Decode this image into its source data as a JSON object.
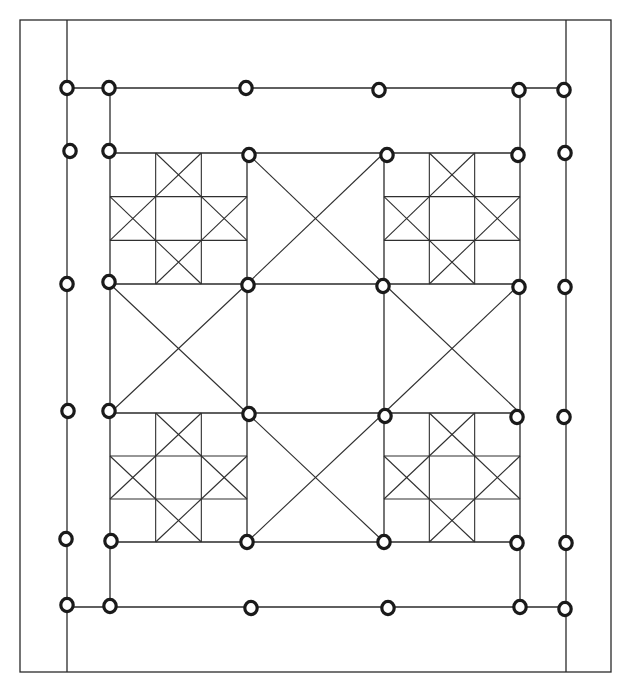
{
  "diagram": {
    "title": "",
    "type": "quilt-grid-layout",
    "frame": {
      "x1": 20,
      "y1": 20,
      "x2": 611,
      "y2": 672
    },
    "outer_verticals": [
      67,
      566
    ],
    "outer_horizontals": [
      88,
      607
    ],
    "inner_x": [
      110,
      247,
      384,
      520
    ],
    "inner_y": [
      153,
      284,
      413,
      542
    ],
    "star_blocks": [
      {
        "position": "top-left",
        "x1": 110,
        "y1": 153,
        "x2": 247,
        "y2": 284
      },
      {
        "position": "top-right",
        "x1": 384,
        "y1": 153,
        "x2": 520,
        "y2": 284
      },
      {
        "position": "bottom-left",
        "x1": 110,
        "y1": 413,
        "x2": 247,
        "y2": 542
      },
      {
        "position": "bottom-right",
        "x1": 384,
        "y1": 413,
        "x2": 520,
        "y2": 542
      }
    ],
    "x_blocks": [
      {
        "position": "top-center",
        "x1": 247,
        "y1": 153,
        "x2": 384,
        "y2": 284
      },
      {
        "position": "middle-left",
        "x1": 110,
        "y1": 284,
        "x2": 247,
        "y2": 413
      },
      {
        "position": "middle-right",
        "x1": 384,
        "y1": 284,
        "x2": 520,
        "y2": 413
      },
      {
        "position": "bottom-center",
        "x1": 247,
        "y1": 413,
        "x2": 384,
        "y2": 542
      }
    ],
    "plain_blocks": [
      {
        "position": "center",
        "x1": 247,
        "y1": 284,
        "x2": 384,
        "y2": 413
      }
    ],
    "nodes": [
      {
        "x": 67,
        "y": 88
      },
      {
        "x": 109,
        "y": 88
      },
      {
        "x": 246,
        "y": 88
      },
      {
        "x": 379,
        "y": 90
      },
      {
        "x": 519,
        "y": 90
      },
      {
        "x": 564,
        "y": 90
      },
      {
        "x": 70,
        "y": 151
      },
      {
        "x": 109,
        "y": 151
      },
      {
        "x": 249,
        "y": 155
      },
      {
        "x": 387,
        "y": 155
      },
      {
        "x": 518,
        "y": 155
      },
      {
        "x": 565,
        "y": 153
      },
      {
        "x": 67,
        "y": 284
      },
      {
        "x": 109,
        "y": 282
      },
      {
        "x": 248,
        "y": 285
      },
      {
        "x": 383,
        "y": 286
      },
      {
        "x": 519,
        "y": 287
      },
      {
        "x": 565,
        "y": 287
      },
      {
        "x": 68,
        "y": 411
      },
      {
        "x": 109,
        "y": 411
      },
      {
        "x": 249,
        "y": 414
      },
      {
        "x": 385,
        "y": 416
      },
      {
        "x": 517,
        "y": 417
      },
      {
        "x": 564,
        "y": 417
      },
      {
        "x": 66,
        "y": 539
      },
      {
        "x": 111,
        "y": 541
      },
      {
        "x": 247,
        "y": 542
      },
      {
        "x": 384,
        "y": 542
      },
      {
        "x": 517,
        "y": 543
      },
      {
        "x": 566,
        "y": 543
      },
      {
        "x": 67,
        "y": 605
      },
      {
        "x": 110,
        "y": 606
      },
      {
        "x": 251,
        "y": 608
      },
      {
        "x": 388,
        "y": 608
      },
      {
        "x": 520,
        "y": 607
      },
      {
        "x": 565,
        "y": 609
      }
    ],
    "colors": {
      "line": "#2a2a2a",
      "node": "#1a1a1a",
      "background": "#ffffff"
    }
  }
}
